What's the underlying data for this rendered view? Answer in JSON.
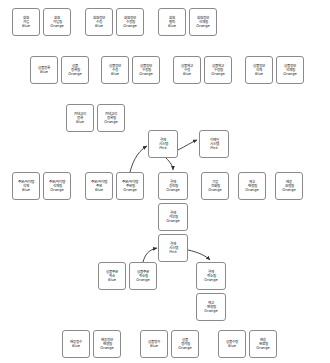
{
  "board": {
    "title": "Event Storming Board",
    "legend": {
      "blue": "Blue",
      "orange": "Orange",
      "pink": "Pink"
    },
    "colors": {
      "blue": "Blue",
      "orange": "Orange",
      "pink": "Pink",
      "border": "#8a8a8a",
      "background": "#ffffff",
      "arrow": "#333333"
    }
  },
  "stickies": [
    {
      "id": "s01",
      "l1": "회원",
      "l2": "가입",
      "tag": "Blue",
      "x": 12,
      "y": 8,
      "w": 28,
      "h": 28
    },
    {
      "id": "s02",
      "l1": "회원",
      "l2": "가입됨",
      "tag": "Orange",
      "x": 43,
      "y": 8,
      "w": 28,
      "h": 28
    },
    {
      "id": "s03",
      "l1": "회원정보",
      "l2": "수정",
      "tag": "Blue",
      "x": 85,
      "y": 8,
      "w": 28,
      "h": 28
    },
    {
      "id": "s04",
      "l1": "회원정보",
      "l2": "수정됨",
      "tag": "Orange",
      "x": 116,
      "y": 8,
      "w": 28,
      "h": 28
    },
    {
      "id": "s05",
      "l1": "회원",
      "l2": "탈퇴",
      "tag": "Blue",
      "x": 158,
      "y": 8,
      "w": 28,
      "h": 28
    },
    {
      "id": "s06",
      "l1": "회원정보",
      "l2": "삭제됨",
      "tag": "Orange",
      "x": 189,
      "y": 8,
      "w": 28,
      "h": 28
    },
    {
      "id": "s07",
      "l1": "상품등록",
      "l2": "",
      "tag": "Blue",
      "x": 30,
      "y": 56,
      "w": 28,
      "h": 28
    },
    {
      "id": "s08",
      "l1": "상품",
      "l2": "등록됨",
      "tag": "Orange",
      "x": 61,
      "y": 56,
      "w": 28,
      "h": 28
    },
    {
      "id": "s09",
      "l1": "상품정보",
      "l2": "수정",
      "tag": "Blue",
      "x": 101,
      "y": 56,
      "w": 28,
      "h": 28
    },
    {
      "id": "s10",
      "l1": "상품정보",
      "l2": "수정됨",
      "tag": "Orange",
      "x": 132,
      "y": 56,
      "w": 28,
      "h": 28
    },
    {
      "id": "s11",
      "l1": "상품재고",
      "l2": "수정",
      "tag": "Blue",
      "x": 173,
      "y": 56,
      "w": 28,
      "h": 28
    },
    {
      "id": "s12",
      "l1": "상품재고",
      "l2": "수정됨",
      "tag": "Orange",
      "x": 204,
      "y": 56,
      "w": 28,
      "h": 28
    },
    {
      "id": "s13",
      "l1": "상품정보",
      "l2": "삭제",
      "tag": "Blue",
      "x": 245,
      "y": 56,
      "w": 28,
      "h": 28
    },
    {
      "id": "s14",
      "l1": "상품정보",
      "l2": "삭제됨",
      "tag": "Orange",
      "x": 276,
      "y": 56,
      "w": 28,
      "h": 28
    },
    {
      "id": "s15",
      "l1": "카테고리",
      "l2": "등록",
      "tag": "Blue",
      "x": 66,
      "y": 104,
      "w": 28,
      "h": 28
    },
    {
      "id": "s16",
      "l1": "카테고리",
      "l2": "등록됨",
      "tag": "Orange",
      "x": 97,
      "y": 104,
      "w": 28,
      "h": 28
    },
    {
      "id": "s17",
      "l1": "결제",
      "l2": "시스템",
      "tag": "Pink",
      "x": 148,
      "y": 130,
      "w": 30,
      "h": 28
    },
    {
      "id": "s18",
      "l1": "이메일",
      "l2": "시스템",
      "tag": "Pink",
      "x": 199,
      "y": 130,
      "w": 30,
      "h": 28
    },
    {
      "id": "s19",
      "l1": "주문/아이템",
      "l2": "삭제",
      "tag": "Blue",
      "x": 12,
      "y": 172,
      "w": 28,
      "h": 28
    },
    {
      "id": "s20",
      "l1": "주문/아이템",
      "l2": "삭제됨",
      "tag": "Orange",
      "x": 43,
      "y": 172,
      "w": 28,
      "h": 28
    },
    {
      "id": "s21",
      "l1": "주문/아이템",
      "l2": "주문",
      "tag": "Blue",
      "x": 85,
      "y": 172,
      "w": 28,
      "h": 28
    },
    {
      "id": "s22",
      "l1": "주문/아이템",
      "l2": "주문됨",
      "tag": "Orange",
      "x": 116,
      "y": 172,
      "w": 28,
      "h": 28
    },
    {
      "id": "s23",
      "l1": "결제",
      "l2": "승인됨",
      "tag": "Orange",
      "x": 158,
      "y": 172,
      "w": 30,
      "h": 28
    },
    {
      "id": "s24",
      "l1": "기업",
      "l2": "전화됨",
      "tag": "Orange",
      "x": 201,
      "y": 172,
      "w": 28,
      "h": 28
    },
    {
      "id": "s25",
      "l1": "재고",
      "l2": "변경됨",
      "tag": "Orange",
      "x": 238,
      "y": 172,
      "w": 28,
      "h": 28
    },
    {
      "id": "s26",
      "l1": "배송",
      "l2": "요청됨",
      "tag": "Orange",
      "x": 275,
      "y": 172,
      "w": 28,
      "h": 28
    },
    {
      "id": "s27",
      "l1": "결제",
      "l2": "거부됨",
      "tag": "Orange",
      "x": 158,
      "y": 203,
      "w": 30,
      "h": 28
    },
    {
      "id": "s28",
      "l1": "결제",
      "l2": "시스템",
      "tag": "Pink",
      "x": 158,
      "y": 234,
      "w": 30,
      "h": 28
    },
    {
      "id": "s29",
      "l1": "상품주문",
      "l2": "취소",
      "tag": "Blue",
      "x": 98,
      "y": 262,
      "w": 28,
      "h": 28
    },
    {
      "id": "s30",
      "l1": "상품주문",
      "l2": "취소됨",
      "tag": "Orange",
      "x": 129,
      "y": 262,
      "w": 28,
      "h": 28
    },
    {
      "id": "s31",
      "l1": "결제",
      "l2": "취소됨",
      "tag": "Orange",
      "x": 196,
      "y": 262,
      "w": 30,
      "h": 28
    },
    {
      "id": "s32",
      "l1": "재고",
      "l2": "변경됨",
      "tag": "Orange",
      "x": 196,
      "y": 293,
      "w": 30,
      "h": 28
    },
    {
      "id": "s33",
      "l1": "배송접수",
      "l2": "",
      "tag": "Blue",
      "x": 62,
      "y": 330,
      "w": 28,
      "h": 28
    },
    {
      "id": "s34",
      "l1": "배송정보",
      "l2": "변경됨",
      "tag": "Orange",
      "x": 93,
      "y": 330,
      "w": 28,
      "h": 28
    },
    {
      "id": "s35",
      "l1": "상품평가",
      "l2": "",
      "tag": "Blue",
      "x": 140,
      "y": 330,
      "w": 28,
      "h": 28
    },
    {
      "id": "s36",
      "l1": "상품",
      "l2": "평가됨",
      "tag": "Orange",
      "x": 171,
      "y": 330,
      "w": 28,
      "h": 28
    },
    {
      "id": "s37",
      "l1": "상품수령",
      "l2": "",
      "tag": "Blue",
      "x": 218,
      "y": 330,
      "w": 28,
      "h": 28
    },
    {
      "id": "s38",
      "l1": "배송",
      "l2": "완료됨",
      "tag": "Orange",
      "x": 249,
      "y": 330,
      "w": 28,
      "h": 28
    }
  ],
  "arrows": [
    {
      "id": "a1",
      "name": "order-placed-to-payment-system",
      "from": "s22",
      "to": "s17",
      "path": "M 130 172 C 132 165 136 152 147 146",
      "label": ""
    },
    {
      "id": "a2",
      "name": "payment-system-to-payment-approved",
      "from": "s17",
      "to": "s23",
      "path": "M 166 158 C 170 162 173 166 173 170",
      "label": ""
    },
    {
      "id": "a3",
      "name": "payment-system-to-email-system",
      "from": "s17",
      "to": "s18",
      "path": "M 178 150 C 186 146 192 142 197 140",
      "label": ""
    },
    {
      "id": "a4",
      "name": "order-cancelled-to-payment-system",
      "from": "s30",
      "to": "s28",
      "path": "M 143 262 C 145 255 148 250 157 248",
      "label": ""
    },
    {
      "id": "a5",
      "name": "payment-system-to-payment-cancelled",
      "from": "s28",
      "to": "s31",
      "path": "M 188 250 C 198 252 206 256 210 260",
      "label": ""
    }
  ]
}
